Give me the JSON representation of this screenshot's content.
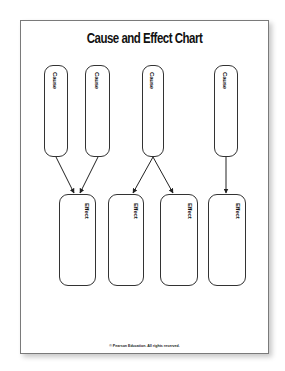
{
  "document": {
    "title": "Cause and Effect Chart",
    "footer": "© Pearson Education. All rights reserved."
  },
  "causes": [
    {
      "label": "Cause"
    },
    {
      "label": "Cause"
    },
    {
      "label": "Cause"
    },
    {
      "label": "Cause"
    }
  ],
  "effects": [
    {
      "label": "Effect"
    },
    {
      "label": "Effect"
    },
    {
      "label": "Effect"
    },
    {
      "label": "Effect"
    }
  ],
  "connections": [
    {
      "from": "cause-1",
      "to": "effect-1"
    },
    {
      "from": "cause-2",
      "to": "effect-1"
    },
    {
      "from": "cause-3",
      "to": "effect-2"
    },
    {
      "from": "cause-3",
      "to": "effect-3"
    },
    {
      "from": "cause-4",
      "to": "effect-4"
    }
  ]
}
